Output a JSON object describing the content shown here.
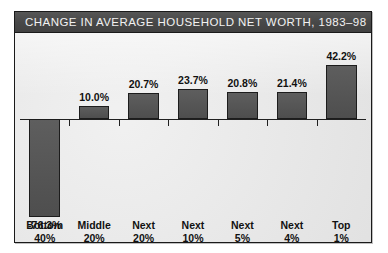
{
  "figure": {
    "title": "CHANGE IN AVERAGE HOUSEHOLD NET WORTH, 1983–98",
    "title_bar_color": "#4b4b4b",
    "title_text_color": "#f2f2f2",
    "plot_background": "#e9e9e9",
    "bar_color": "#565656",
    "border_color": "#1a1a1a"
  },
  "chart_data": {
    "type": "bar",
    "title": "CHANGE IN AVERAGE HOUSEHOLD NET WORTH, 1983–98",
    "xlabel": "",
    "ylabel": "",
    "grid": false,
    "legend": false,
    "ylim": [
      -80,
      45
    ],
    "zero_line": true,
    "categories": [
      "Bottom 40%",
      "Middle 20%",
      "Next 20%",
      "Next 10%",
      "Next 5%",
      "Next 4%",
      "Top 1%"
    ],
    "category_lines": [
      [
        "Bottom",
        "40%"
      ],
      [
        "Middle",
        "20%"
      ],
      [
        "Next",
        "20%"
      ],
      [
        "Next",
        "10%"
      ],
      [
        "Next",
        "5%"
      ],
      [
        "Next",
        "4%"
      ],
      [
        "Top",
        "1%"
      ]
    ],
    "values": [
      -76.3,
      10.0,
      20.7,
      23.7,
      20.8,
      21.4,
      42.2
    ],
    "value_labels": [
      "-76.3%",
      "10.0%",
      "20.7%",
      "23.7%",
      "20.8%",
      "21.4%",
      "42.2%"
    ]
  }
}
